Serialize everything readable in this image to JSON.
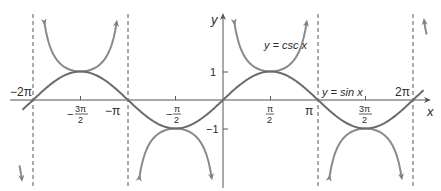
{
  "chart_data": {
    "type": "line",
    "title": "",
    "xlabel": "x",
    "ylabel": "y",
    "xlim": [
      -6.5,
      6.7
    ],
    "ylim": [
      -3,
      3
    ],
    "series": [
      {
        "name": "y = sin x",
        "function": "sin(x)",
        "color": "#6b6b6b"
      },
      {
        "name": "y = csc x",
        "function": "1/sin(x)",
        "color": "#8a8a8a"
      }
    ],
    "asymptotes_x": [
      "-2π",
      "-π",
      "π",
      "2π"
    ],
    "x_ticks": [
      "-2π",
      "-3π/2",
      "-π",
      "-π/2",
      "π/2",
      "π",
      "3π/2",
      "2π"
    ],
    "y_ticks": [
      "1",
      "-1"
    ]
  },
  "labels": {
    "x_axis": "x",
    "y_axis": "y",
    "csc_label": "y = csc x",
    "sin_label": "y = sin x",
    "tick_neg2pi": "−2π",
    "tick_negpi": "−π",
    "tick_pi": "π",
    "tick_2pi": "2π",
    "tick_neg3pi2_num": "3π",
    "tick_negpi2_num": "π",
    "tick_pi2_num": "π",
    "tick_3pi2_num": "3π",
    "tick_den": "2",
    "minus": "−",
    "y_one": "1",
    "y_neg_one": "−1"
  }
}
